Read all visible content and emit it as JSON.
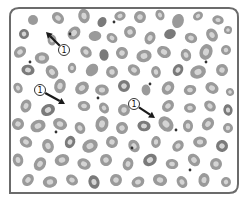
{
  "figure": {
    "frame": {
      "x": 10,
      "y": 8,
      "w": 228,
      "h": 185,
      "radius": 9,
      "stroke": "#6b6b6b"
    },
    "colors": {
      "background": "#ffffff",
      "cell_fill": "#9a9a9a",
      "cell_center": "#d4d4d4",
      "cell_dark": "#7a7a7a",
      "arrow": "#1a1a1a",
      "label_stroke": "#333333"
    },
    "callouts": [
      {
        "label": "1",
        "cx": 64,
        "cy": 50,
        "x2": 46,
        "y2": 32
      },
      {
        "label": "1",
        "cx": 40,
        "cy": 90,
        "x2": 65,
        "y2": 104
      },
      {
        "label": "1",
        "cx": 134,
        "cy": 104,
        "x2": 155,
        "y2": 118
      }
    ],
    "cells": [
      [
        33,
        20,
        5,
        0
      ],
      [
        58,
        18,
        6,
        1
      ],
      [
        84,
        16,
        6,
        1
      ],
      [
        102,
        22,
        5,
        0
      ],
      [
        120,
        16,
        5,
        1
      ],
      [
        140,
        17,
        6,
        1
      ],
      [
        160,
        15,
        5,
        1
      ],
      [
        178,
        21,
        6,
        0
      ],
      [
        198,
        16,
        5,
        1
      ],
      [
        218,
        20,
        5,
        1
      ],
      [
        24,
        34,
        5,
        1
      ],
      [
        52,
        40,
        5,
        1
      ],
      [
        74,
        33,
        6,
        1
      ],
      [
        95,
        36,
        6,
        0
      ],
      [
        112,
        38,
        5,
        1
      ],
      [
        130,
        32,
        6,
        1
      ],
      [
        150,
        38,
        6,
        1
      ],
      [
        170,
        34,
        5,
        0
      ],
      [
        191,
        38,
        6,
        1
      ],
      [
        212,
        35,
        6,
        1
      ],
      [
        228,
        30,
        4,
        1
      ],
      [
        20,
        52,
        6,
        1
      ],
      [
        42,
        58,
        6,
        1
      ],
      [
        86,
        52,
        6,
        1
      ],
      [
        104,
        55,
        5,
        0
      ],
      [
        122,
        53,
        6,
        1
      ],
      [
        144,
        56,
        7,
        1
      ],
      [
        164,
        52,
        6,
        1
      ],
      [
        186,
        55,
        6,
        1
      ],
      [
        206,
        52,
        7,
        1
      ],
      [
        226,
        50,
        5,
        1
      ],
      [
        28,
        70,
        6,
        1
      ],
      [
        52,
        72,
        6,
        1
      ],
      [
        72,
        68,
        5,
        1
      ],
      [
        92,
        70,
        6,
        0
      ],
      [
        112,
        72,
        6,
        1
      ],
      [
        134,
        70,
        6,
        1
      ],
      [
        156,
        72,
        5,
        1
      ],
      [
        178,
        70,
        6,
        1
      ],
      [
        198,
        72,
        7,
        1
      ],
      [
        222,
        70,
        6,
        1
      ],
      [
        18,
        88,
        5,
        1
      ],
      [
        60,
        86,
        6,
        1
      ],
      [
        82,
        88,
        7,
        1
      ],
      [
        102,
        90,
        6,
        1
      ],
      [
        124,
        86,
        6,
        1
      ],
      [
        146,
        90,
        5,
        0
      ],
      [
        168,
        88,
        6,
        1
      ],
      [
        190,
        90,
        6,
        1
      ],
      [
        212,
        88,
        6,
        1
      ],
      [
        230,
        92,
        4,
        1
      ],
      [
        26,
        106,
        6,
        1
      ],
      [
        48,
        110,
        6,
        1
      ],
      [
        84,
        106,
        6,
        1
      ],
      [
        104,
        108,
        5,
        1
      ],
      [
        124,
        110,
        6,
        1
      ],
      [
        168,
        106,
        6,
        1
      ],
      [
        190,
        108,
        5,
        1
      ],
      [
        210,
        106,
        6,
        1
      ],
      [
        228,
        110,
        5,
        1
      ],
      [
        18,
        124,
        6,
        1
      ],
      [
        38,
        126,
        7,
        1
      ],
      [
        60,
        124,
        6,
        1
      ],
      [
        80,
        128,
        6,
        1
      ],
      [
        102,
        124,
        7,
        1
      ],
      [
        122,
        128,
        6,
        1
      ],
      [
        144,
        126,
        6,
        1
      ],
      [
        166,
        124,
        7,
        1
      ],
      [
        188,
        126,
        6,
        1
      ],
      [
        208,
        124,
        6,
        1
      ],
      [
        228,
        128,
        5,
        1
      ],
      [
        26,
        142,
        6,
        1
      ],
      [
        48,
        146,
        6,
        1
      ],
      [
        70,
        142,
        6,
        1
      ],
      [
        90,
        146,
        7,
        1
      ],
      [
        112,
        142,
        6,
        1
      ],
      [
        134,
        146,
        6,
        1
      ],
      [
        156,
        142,
        5,
        1
      ],
      [
        178,
        146,
        6,
        1
      ],
      [
        200,
        142,
        6,
        1
      ],
      [
        222,
        146,
        6,
        1
      ],
      [
        18,
        160,
        6,
        1
      ],
      [
        40,
        164,
        6,
        1
      ],
      [
        62,
        160,
        7,
        1
      ],
      [
        84,
        164,
        6,
        1
      ],
      [
        106,
        160,
        6,
        1
      ],
      [
        128,
        164,
        6,
        1
      ],
      [
        150,
        160,
        6,
        1
      ],
      [
        172,
        164,
        6,
        1
      ],
      [
        194,
        160,
        6,
        1
      ],
      [
        216,
        164,
        6,
        1
      ],
      [
        28,
        180,
        6,
        1
      ],
      [
        50,
        182,
        6,
        1
      ],
      [
        72,
        180,
        6,
        1
      ],
      [
        94,
        182,
        6,
        1
      ],
      [
        116,
        180,
        6,
        1
      ],
      [
        138,
        182,
        6,
        1
      ],
      [
        160,
        180,
        6,
        1
      ],
      [
        182,
        182,
        6,
        1
      ],
      [
        204,
        180,
        6,
        1
      ],
      [
        226,
        182,
        5,
        1
      ]
    ],
    "dots": [
      [
        30,
        62
      ],
      [
        114,
        22
      ],
      [
        70,
        34
      ],
      [
        150,
        84
      ],
      [
        132,
        148
      ],
      [
        176,
        130
      ],
      [
        98,
        98
      ],
      [
        206,
        62
      ],
      [
        56,
        132
      ],
      [
        190,
        170
      ]
    ]
  }
}
